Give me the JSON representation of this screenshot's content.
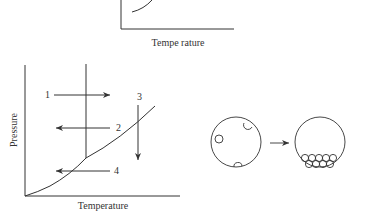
{
  "top_chart": {
    "xlabel": "Tempe rature"
  },
  "phase_diagram": {
    "xlabel": "Temperature",
    "ylabel": "Pressure",
    "arrow_labels": [
      "1",
      "2",
      "3",
      "4"
    ]
  },
  "particles_figure": {
    "arrow": "right-arrow"
  },
  "colors": {
    "line": "#333333",
    "background": "#ffffff"
  }
}
